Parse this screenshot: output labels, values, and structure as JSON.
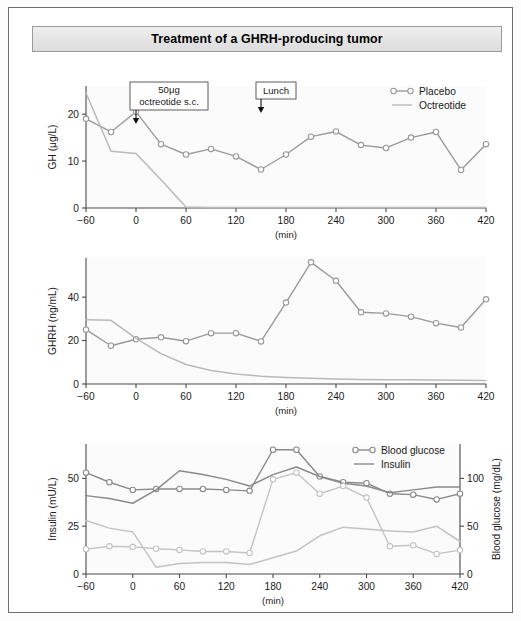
{
  "figure": {
    "title": "Treatment of a GHRH-producing tumor"
  },
  "axis": {
    "x_label": "(min)",
    "x_ticks": [
      "−60",
      "0",
      "60",
      "120",
      "180",
      "240",
      "300",
      "360",
      "420"
    ],
    "x_tick_values": [
      -60,
      0,
      60,
      120,
      180,
      240,
      300,
      360,
      420
    ],
    "x_min": -60,
    "x_max": 420
  },
  "annotations": [
    {
      "name": "octreotide-dose",
      "line1": "50μg",
      "line2": "octreotide s.c.",
      "at_x": 0
    },
    {
      "name": "lunch",
      "line1": "Lunch",
      "line2": "",
      "at_x": 150
    }
  ],
  "colors": {
    "placebo": "#9a9a9a",
    "octreotide": "#b9b9b9",
    "blood_glucose": "#8a8a8a",
    "insulin": "#c3c3c3",
    "axis": "#4a4a4a",
    "frame": "#6f6f6f",
    "title_bg": "#e6e6e6"
  },
  "chart_data": [
    {
      "type": "line",
      "name": "panel-gh",
      "title": "",
      "xlabel": "(min)",
      "ylabel": "GH (μg/L)",
      "ylim": [
        0,
        26
      ],
      "y_ticks": [
        0,
        10,
        20
      ],
      "y_tick_labels": [
        "0",
        "10",
        "20"
      ],
      "grid": false,
      "legend": {
        "position": "top-right",
        "entries": [
          "Placebo",
          "Octreotide"
        ]
      },
      "x": [
        -60,
        -30,
        0,
        30,
        60,
        90,
        120,
        150,
        180,
        210,
        240,
        270,
        300,
        330,
        360,
        390,
        420
      ],
      "series": [
        {
          "name": "Placebo",
          "marker": "open-circle",
          "color": "#9a9a9a",
          "values": [
            19.0,
            16.2,
            20.5,
            13.6,
            11.4,
            12.6,
            11.0,
            8.2,
            11.4,
            15.2,
            16.3,
            13.4,
            12.8,
            15.0,
            16.2,
            8.1,
            13.6
          ]
        },
        {
          "name": "Octreotide",
          "marker": "none",
          "color": "#b9b9b9",
          "values": [
            24.5,
            12.1,
            11.6,
            6.0,
            0.2,
            0.1,
            0.1,
            0.1,
            0.1,
            0.1,
            0.1,
            0.1,
            0.1,
            0.1,
            0.1,
            0.1,
            0.1
          ]
        }
      ]
    },
    {
      "type": "line",
      "name": "panel-ghrh",
      "title": "",
      "xlabel": "(min)",
      "ylabel": "GHRH (ng/mL)",
      "ylim": [
        0,
        58
      ],
      "y_ticks": [
        0,
        20,
        40
      ],
      "y_tick_labels": [
        "0",
        "20",
        "40"
      ],
      "grid": false,
      "legend": null,
      "x": [
        -60,
        -30,
        0,
        30,
        60,
        90,
        120,
        150,
        180,
        210,
        240,
        270,
        300,
        330,
        360,
        390,
        420
      ],
      "series": [
        {
          "name": "Placebo",
          "marker": "open-circle",
          "color": "#9a9a9a",
          "values": [
            25.0,
            17.6,
            20.6,
            21.5,
            19.7,
            23.4,
            23.4,
            19.6,
            37.5,
            56.0,
            47.5,
            33.0,
            32.5,
            31.0,
            28.0,
            26.0,
            39.0
          ]
        },
        {
          "name": "Octreotide",
          "marker": "none",
          "color": "#b9b9b9",
          "values": [
            29.6,
            29.3,
            21.0,
            14.0,
            9.0,
            6.2,
            4.6,
            3.6,
            3.0,
            2.6,
            2.3,
            2.1,
            2.0,
            1.9,
            1.8,
            1.7,
            1.6
          ]
        }
      ]
    },
    {
      "type": "line",
      "name": "panel-insulin-glucose",
      "title": "",
      "xlabel": "(min)",
      "ylabel": "Insulin (mU/L)",
      "ylabel_right": "Blood glucose (mg/dL)",
      "ylim": [
        0,
        68
      ],
      "y_ticks": [
        0,
        25,
        50
      ],
      "y_tick_labels": [
        "0",
        "25",
        "50"
      ],
      "ylim_right": [
        0,
        136
      ],
      "y_ticks_right": [
        0,
        50,
        100
      ],
      "y_tick_labels_right": [
        "0",
        "50",
        "100"
      ],
      "grid": false,
      "legend": {
        "position": "top-right",
        "entries": [
          "Blood glucose",
          "Insulin"
        ]
      },
      "x": [
        -60,
        -30,
        0,
        30,
        60,
        90,
        120,
        150,
        180,
        210,
        240,
        270,
        300,
        330,
        360,
        390,
        420
      ],
      "series": [
        {
          "name": "Blood glucose placebo",
          "axis": "right",
          "marker": "open-circle",
          "color": "#8a8a8a",
          "values": [
            106,
            96,
            88,
            89,
            89,
            89,
            88,
            87,
            130,
            130,
            102,
            96,
            95,
            84,
            83,
            78,
            84
          ]
        },
        {
          "name": "Blood glucose octreotide",
          "axis": "right",
          "marker": "none",
          "color": "#8a8a8a",
          "values": [
            82,
            79,
            74,
            88,
            108,
            104,
            99,
            92,
            104,
            112,
            102,
            95,
            92,
            85,
            88,
            91,
            91
          ]
        },
        {
          "name": "Insulin placebo",
          "axis": "left",
          "marker": "open-circle",
          "color": "#c3c3c3",
          "values": [
            13.0,
            14.5,
            14.2,
            13.2,
            12.6,
            11.8,
            11.8,
            11.0,
            49.5,
            53.0,
            42.0,
            46.0,
            40.0,
            14.5,
            15.0,
            10.5,
            12.5
          ]
        },
        {
          "name": "Insulin octreotide",
          "axis": "left",
          "marker": "none",
          "color": "#c3c3c3",
          "values": [
            28.0,
            24.0,
            22.0,
            3.5,
            5.5,
            6.0,
            6.0,
            5.0,
            8.5,
            12.0,
            20.0,
            24.5,
            23.5,
            22.5,
            22.0,
            25.0,
            17.0
          ]
        }
      ]
    }
  ]
}
